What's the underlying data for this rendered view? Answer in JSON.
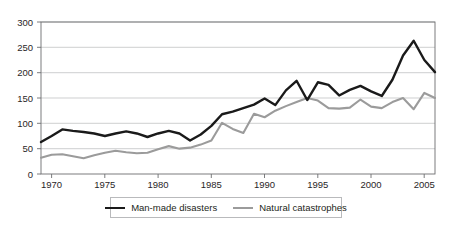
{
  "chart_data": {
    "type": "line",
    "title": "",
    "subtitle": "",
    "xlabel": "",
    "ylabel": "",
    "xlim": [
      1969,
      2006
    ],
    "ylim": [
      0,
      300
    ],
    "grid": true,
    "legend_position": "bottom",
    "y_ticks": [
      "0",
      "50",
      "100",
      "150",
      "200",
      "250",
      "300"
    ],
    "y_tick_values": [
      0,
      50,
      100,
      150,
      200,
      250,
      300
    ],
    "x_ticks": [
      "1970",
      "1975",
      "1980",
      "1985",
      "1990",
      "1995",
      "2000",
      "2005"
    ],
    "x_tick_values": [
      1970,
      1975,
      1980,
      1985,
      1990,
      1995,
      2000,
      2005
    ],
    "x": [
      1969,
      1970,
      1971,
      1972,
      1973,
      1974,
      1975,
      1976,
      1977,
      1978,
      1979,
      1980,
      1981,
      1982,
      1983,
      1984,
      1985,
      1986,
      1987,
      1988,
      1989,
      1990,
      1991,
      1992,
      1993,
      1994,
      1995,
      1996,
      1997,
      1998,
      1999,
      2000,
      2001,
      2002,
      2003,
      2004,
      2005,
      2006
    ],
    "series": [
      {
        "name": "Man-made disasters",
        "color": "#1a1a1a",
        "width": 2.4,
        "values": [
          63,
          75,
          88,
          85,
          83,
          80,
          75,
          80,
          84,
          80,
          73,
          80,
          85,
          80,
          66,
          78,
          95,
          118,
          123,
          130,
          137,
          149,
          136,
          165,
          184,
          146,
          181,
          176,
          155,
          166,
          174,
          163,
          154,
          186,
          234,
          263,
          225,
          201
        ]
      },
      {
        "name": "Natural catastrophes",
        "color": "#9b9b9b",
        "width": 2.1,
        "values": [
          32,
          38,
          39,
          35,
          31,
          37,
          42,
          46,
          43,
          41,
          42,
          49,
          55,
          50,
          52,
          58,
          66,
          101,
          89,
          81,
          119,
          112,
          125,
          134,
          142,
          150,
          145,
          130,
          129,
          131,
          147,
          133,
          130,
          142,
          150,
          128,
          160,
          150
        ]
      }
    ],
    "legend": [
      {
        "label": "Man-made disasters",
        "color": "#1a1a1a"
      },
      {
        "label": "Natural catastrophes",
        "color": "#9b9b9b"
      }
    ]
  }
}
